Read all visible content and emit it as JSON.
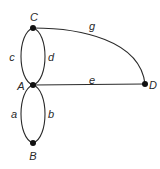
{
  "diagram": {
    "type": "graph",
    "colors": {
      "stroke": "#2a2a2a",
      "node": "#111111",
      "background": "#ffffff"
    },
    "nodes": [
      {
        "id": "C",
        "label": "C",
        "x": 33,
        "y": 28,
        "label_x": 34,
        "label_y": 17
      },
      {
        "id": "A",
        "label": "A",
        "x": 33,
        "y": 85,
        "label_x": 21,
        "label_y": 86
      },
      {
        "id": "B",
        "label": "B",
        "x": 33,
        "y": 143,
        "label_x": 33,
        "label_y": 156
      },
      {
        "id": "D",
        "label": "D",
        "x": 145,
        "y": 84,
        "label_x": 153,
        "label_y": 85
      }
    ],
    "edges": [
      {
        "id": "c",
        "label": "c",
        "from": "A",
        "to": "C",
        "label_x": 12,
        "label_y": 57
      },
      {
        "id": "d",
        "label": "d",
        "from": "A",
        "to": "C",
        "label_x": 51,
        "label_y": 57
      },
      {
        "id": "a",
        "label": "a",
        "from": "A",
        "to": "B",
        "label_x": 14,
        "label_y": 114
      },
      {
        "id": "b",
        "label": "b",
        "from": "A",
        "to": "B",
        "label_x": 51,
        "label_y": 114
      },
      {
        "id": "e",
        "label": "e",
        "from": "A",
        "to": "D",
        "label_x": 92,
        "label_y": 80
      },
      {
        "id": "g",
        "label": "g",
        "from": "C",
        "to": "D",
        "label_x": 92,
        "label_y": 26
      }
    ]
  }
}
